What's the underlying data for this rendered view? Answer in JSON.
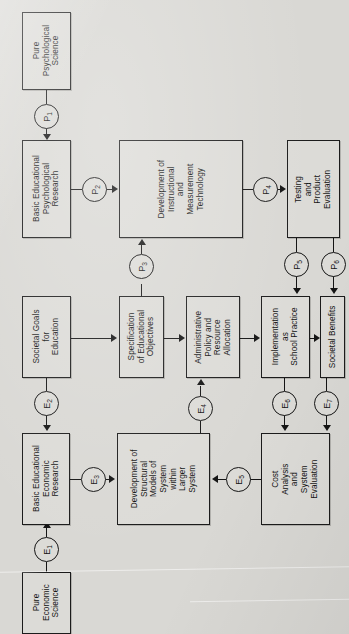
{
  "figure": {
    "orientation": "rotated-90-ccw",
    "background_color": "#d9d8d4",
    "ink_color": "#141414"
  },
  "chart_data": {
    "type": "diagram",
    "title": "",
    "nodes": [
      {
        "id": "pure_psych",
        "label": "Pure\nPsychological\nScience"
      },
      {
        "id": "basic_psych",
        "label": "Basic Educational\nPsychological\nResearch"
      },
      {
        "id": "dev_tech",
        "label": "Development of\nInstructional\nand\nMeasurement\nTechnology"
      },
      {
        "id": "testing",
        "label": "Testing\nand\nProduct\nEvaluation"
      },
      {
        "id": "societal_goals",
        "label": "Societal Goals\nfor\nEducation"
      },
      {
        "id": "spec_obj",
        "label": "Specification\nof Educational\nObjectives"
      },
      {
        "id": "admin_policy",
        "label": "Administrative\nPolicy and\nResource\nAllocation"
      },
      {
        "id": "implementation",
        "label": "Implementation\nas\nSchool Practice"
      },
      {
        "id": "societal_ben",
        "label": "Societal Benefits"
      },
      {
        "id": "basic_econ",
        "label": "Basic Educational\nEconomic\nResearch"
      },
      {
        "id": "struct_models",
        "label": "Development of\nStructural\nModels of\nSystem\nwithin\nLarger\nSystem"
      },
      {
        "id": "cost_analysis",
        "label": "Cost\nAnalysis\nand\nSystem\nEvaluation"
      },
      {
        "id": "pure_econ",
        "label": "Pure\nEconomic\nScience"
      }
    ],
    "edges": [
      {
        "id": "P1",
        "base": "P",
        "sub": "1",
        "from": "pure_psych",
        "to": "basic_psych"
      },
      {
        "id": "P2",
        "base": "P",
        "sub": "2",
        "from": "basic_psych",
        "to": "dev_tech"
      },
      {
        "id": "P3",
        "base": "P",
        "sub": "3",
        "from": "spec_obj",
        "to": "dev_tech"
      },
      {
        "id": "P4",
        "base": "P",
        "sub": "4",
        "from": "dev_tech",
        "to": "testing"
      },
      {
        "id": "P5",
        "base": "P",
        "sub": "5",
        "from": "testing",
        "to": "implementation"
      },
      {
        "id": "P6",
        "base": "P",
        "sub": "6",
        "from": "testing",
        "to": "societal_ben"
      },
      {
        "id": "E1",
        "base": "E",
        "sub": "1",
        "from": "pure_econ",
        "to": "basic_econ"
      },
      {
        "id": "E2",
        "base": "E",
        "sub": "2",
        "from": "societal_goals",
        "to": "basic_econ"
      },
      {
        "id": "E3",
        "base": "E",
        "sub": "3",
        "from": "basic_econ",
        "to": "struct_models"
      },
      {
        "id": "E4",
        "base": "E",
        "sub": "4",
        "from": "struct_models",
        "to": "admin_policy"
      },
      {
        "id": "E5",
        "base": "E",
        "sub": "5",
        "from": "cost_analysis",
        "to": "struct_models"
      },
      {
        "id": "E6",
        "base": "E",
        "sub": "6",
        "from": "implementation",
        "to": "cost_analysis"
      },
      {
        "id": "E7",
        "base": "E",
        "sub": "7",
        "from": "societal_ben",
        "to": "cost_analysis"
      }
    ],
    "unlabeled_edges": [
      {
        "from": "societal_goals",
        "to": "spec_obj"
      },
      {
        "from": "spec_obj",
        "to": "admin_policy"
      },
      {
        "from": "admin_policy",
        "to": "implementation"
      },
      {
        "from": "implementation",
        "to": "societal_ben"
      }
    ]
  }
}
